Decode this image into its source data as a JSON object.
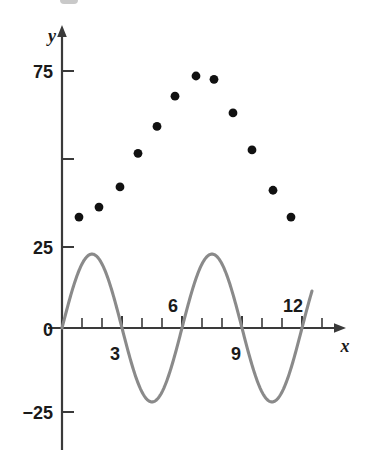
{
  "figure": {
    "background_color": "#ffffff",
    "axis_color": "#3a3a3a",
    "point_color": "#111111",
    "curve_color": "#8a8a8a",
    "x_axis_label": "x",
    "y_axis_label": "y"
  },
  "chart_data": {
    "type": "scatter",
    "title": "",
    "subtitle": "",
    "xlabel": "x",
    "ylabel": "y",
    "xlim": [
      -0.6,
      14.2
    ],
    "ylim": [
      -36,
      90
    ],
    "grid": false,
    "legend": null,
    "x_ticks": [
      0,
      1,
      2,
      3,
      4,
      5,
      6,
      7,
      8,
      9,
      10,
      11,
      12,
      13,
      14
    ],
    "x_tick_labels": [
      "",
      "",
      "",
      "3",
      "",
      "",
      "6",
      "",
      "",
      "9",
      "",
      "",
      "12",
      "",
      ""
    ],
    "x_tick_labels_shown": [
      "3",
      "6",
      "12"
    ],
    "y_ticks": [
      -25,
      0,
      25,
      50,
      75
    ],
    "y_tick_labels": [
      "−25",
      "0",
      "25",
      "",
      "75"
    ],
    "y_tick_labels_shown": [
      "75",
      "25",
      "0",
      "−25"
    ],
    "series": [
      {
        "name": "data points",
        "type": "scatter",
        "marker": "filled-circle",
        "color": "#111111",
        "points": [
          {
            "x": 0.85,
            "y": 33
          },
          {
            "x": 1.85,
            "y": 36
          },
          {
            "x": 2.9,
            "y": 42
          },
          {
            "x": 3.8,
            "y": 52
          },
          {
            "x": 4.75,
            "y": 60
          },
          {
            "x": 5.65,
            "y": 69
          },
          {
            "x": 6.7,
            "y": 75
          },
          {
            "x": 7.6,
            "y": 74
          },
          {
            "x": 8.55,
            "y": 64
          },
          {
            "x": 9.5,
            "y": 53
          },
          {
            "x": 10.55,
            "y": 41
          },
          {
            "x": 11.45,
            "y": 33
          }
        ]
      },
      {
        "name": "sinusoidal curve",
        "type": "line",
        "color": "#8a8a8a",
        "function": "y = 22 * sin(2*pi*x/6)",
        "amplitude": 22,
        "period": 6,
        "phase": 0,
        "x_start": 0,
        "x_end": 12.5,
        "peaks": [
          {
            "x": 1.5,
            "y": 22
          },
          {
            "x": 7.5,
            "y": 22
          }
        ],
        "troughs": [
          {
            "x": 4.5,
            "y": -22
          },
          {
            "x": 10.5,
            "y": -22
          }
        ],
        "zero_crossings": [
          0,
          3,
          6,
          9,
          12
        ]
      }
    ]
  }
}
